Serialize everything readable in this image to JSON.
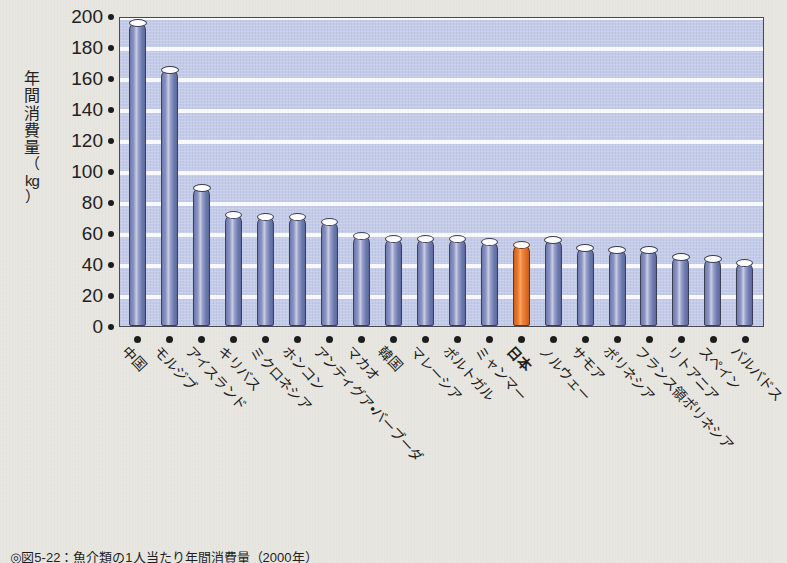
{
  "chart_data": {
    "type": "bar",
    "title": "",
    "xlabel": "",
    "ylabel": "年間消費量（kg）",
    "ylim": [
      0,
      200
    ],
    "ytick_step": 20,
    "yticks": [
      200,
      180,
      160,
      140,
      120,
      100,
      80,
      60,
      40,
      20,
      0
    ],
    "grid": true,
    "legend": "none",
    "highlight_index": 12,
    "highlight_color": "#ea7a2c",
    "bar_color": "#7b86b8",
    "plot_background": "#c3cbe8",
    "page_background": "#e8e6e0",
    "categories": [
      "中国",
      "モルジブ",
      "アイスランド",
      "キリバス",
      "ミクロネシア",
      "ホンコン",
      "アンティグア・バーブーダ",
      "マカオ",
      "韓国",
      "マレーシア",
      "ポルトガル",
      "ミャンマー",
      "日本",
      "ノルウェー",
      "サモア",
      "ポリネシア",
      "フランス領ポリネシア",
      "リトアニア",
      "スペイン",
      "バルバドス"
    ],
    "values": [
      196,
      166,
      90,
      72,
      71,
      71,
      68,
      59,
      57,
      57,
      57,
      55,
      53,
      56,
      51,
      50,
      50,
      45,
      44,
      41
    ]
  },
  "axis": {
    "y_label_chars": [
      "年",
      "間",
      "消",
      "費",
      "量"
    ],
    "y_label_paren_open": "（",
    "y_label_unit": "kg",
    "y_label_paren_close": "）"
  },
  "caption": {
    "text": "◎図5-22：魚介類の1人当たり年間消費量（2000年）"
  }
}
